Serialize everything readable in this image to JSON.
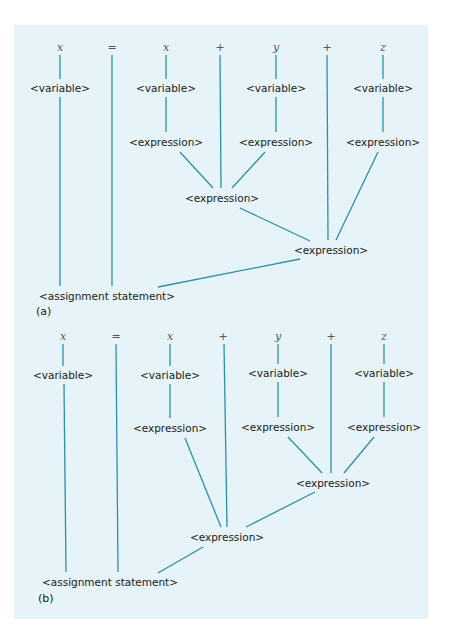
{
  "figure": {
    "colors": {
      "background": "#e6f3f8",
      "edge": "#2f8fa8",
      "text": "#1a1a1a",
      "terminal": "#555555"
    },
    "panels": [
      {
        "label": "(a)",
        "label_pos": [
          36,
          305
        ],
        "nodes": [
          {
            "id": "t1",
            "text": "x",
            "kind": "term",
            "x": 60,
            "y": 47
          },
          {
            "id": "t2",
            "text": "=",
            "kind": "op",
            "x": 112,
            "y": 47
          },
          {
            "id": "t3",
            "text": "x",
            "kind": "term",
            "x": 166,
            "y": 47
          },
          {
            "id": "t4",
            "text": "+",
            "kind": "op",
            "x": 220,
            "y": 47
          },
          {
            "id": "t5",
            "text": "y",
            "kind": "term",
            "x": 276,
            "y": 47
          },
          {
            "id": "t6",
            "text": "+",
            "kind": "op",
            "x": 327,
            "y": 47
          },
          {
            "id": "t7",
            "text": "z",
            "kind": "term",
            "x": 383,
            "y": 47
          },
          {
            "id": "v1",
            "text": "<variable>",
            "kind": "nt",
            "x": 60,
            "y": 88
          },
          {
            "id": "v2",
            "text": "<variable>",
            "kind": "nt",
            "x": 166,
            "y": 88
          },
          {
            "id": "v3",
            "text": "<variable>",
            "kind": "nt",
            "x": 276,
            "y": 88
          },
          {
            "id": "v4",
            "text": "<variable>",
            "kind": "nt",
            "x": 383,
            "y": 88
          },
          {
            "id": "e1",
            "text": "<expression>",
            "kind": "nt",
            "x": 166,
            "y": 142
          },
          {
            "id": "e2",
            "text": "<expression>",
            "kind": "nt",
            "x": 276,
            "y": 142
          },
          {
            "id": "e3",
            "text": "<expression>",
            "kind": "nt",
            "x": 383,
            "y": 142
          },
          {
            "id": "e4",
            "text": "<expression>",
            "kind": "nt",
            "x": 222,
            "y": 198
          },
          {
            "id": "e5",
            "text": "<expression>",
            "kind": "nt",
            "x": 331,
            "y": 250
          },
          {
            "id": "a1",
            "text": "<assignment statement>",
            "kind": "nt",
            "x": 107,
            "y": 296
          }
        ],
        "edges": [
          [
            60,
            55,
            60,
            79
          ],
          [
            166,
            55,
            166,
            79
          ],
          [
            276,
            55,
            276,
            79
          ],
          [
            383,
            55,
            383,
            79
          ],
          [
            60,
            97,
            60,
            286
          ],
          [
            112,
            55,
            112,
            286
          ],
          [
            166,
            97,
            166,
            132
          ],
          [
            276,
            97,
            276,
            132
          ],
          [
            383,
            97,
            383,
            132
          ],
          [
            180,
            152,
            213,
            188
          ],
          [
            220,
            55,
            221,
            188
          ],
          [
            265,
            152,
            232,
            188
          ],
          [
            240,
            208,
            310,
            241
          ],
          [
            327,
            55,
            328,
            240
          ],
          [
            378,
            152,
            336,
            240
          ],
          [
            300,
            259,
            158,
            287
          ]
        ]
      },
      {
        "label": "(b)",
        "label_pos": [
          38,
          592
        ],
        "nodes": [
          {
            "id": "t1",
            "text": "x",
            "kind": "term",
            "x": 63,
            "y": 336
          },
          {
            "id": "t2",
            "text": "=",
            "kind": "op",
            "x": 116,
            "y": 336
          },
          {
            "id": "t3",
            "text": "x",
            "kind": "term",
            "x": 170,
            "y": 336
          },
          {
            "id": "t4",
            "text": "+",
            "kind": "op",
            "x": 223,
            "y": 336
          },
          {
            "id": "t5",
            "text": "y",
            "kind": "term",
            "x": 278,
            "y": 336
          },
          {
            "id": "t6",
            "text": "+",
            "kind": "op",
            "x": 331,
            "y": 336
          },
          {
            "id": "t7",
            "text": "z",
            "kind": "term",
            "x": 384,
            "y": 336
          },
          {
            "id": "v1",
            "text": "<variable>",
            "kind": "nt",
            "x": 63,
            "y": 375
          },
          {
            "id": "v2",
            "text": "<variable>",
            "kind": "nt",
            "x": 170,
            "y": 375
          },
          {
            "id": "v3",
            "text": "<variable>",
            "kind": "nt",
            "x": 278,
            "y": 373
          },
          {
            "id": "v4",
            "text": "<variable>",
            "kind": "nt",
            "x": 384,
            "y": 373
          },
          {
            "id": "e1",
            "text": "<expression>",
            "kind": "nt",
            "x": 170,
            "y": 428
          },
          {
            "id": "e2",
            "text": "<expression>",
            "kind": "nt",
            "x": 278,
            "y": 427
          },
          {
            "id": "e3",
            "text": "<expression>",
            "kind": "nt",
            "x": 384,
            "y": 427
          },
          {
            "id": "e4",
            "text": "<expression>",
            "kind": "nt",
            "x": 333,
            "y": 483
          },
          {
            "id": "e5",
            "text": "<expression>",
            "kind": "nt",
            "x": 227,
            "y": 537
          },
          {
            "id": "a1",
            "text": "<assignment statement>",
            "kind": "nt",
            "x": 110,
            "y": 582
          }
        ],
        "edges": [
          [
            63,
            344,
            63,
            366
          ],
          [
            170,
            344,
            170,
            366
          ],
          [
            278,
            344,
            278,
            364
          ],
          [
            384,
            344,
            384,
            364
          ],
          [
            64,
            384,
            66,
            572
          ],
          [
            116,
            344,
            118,
            572
          ],
          [
            170,
            384,
            170,
            418
          ],
          [
            278,
            382,
            278,
            417
          ],
          [
            384,
            382,
            384,
            417
          ],
          [
            288,
            437,
            322,
            473
          ],
          [
            331,
            344,
            331,
            473
          ],
          [
            374,
            437,
            344,
            473
          ],
          [
            185,
            438,
            221,
            527
          ],
          [
            224,
            344,
            227,
            527
          ],
          [
            315,
            492,
            246,
            527
          ],
          [
            203,
            547,
            158,
            573
          ]
        ]
      }
    ]
  }
}
